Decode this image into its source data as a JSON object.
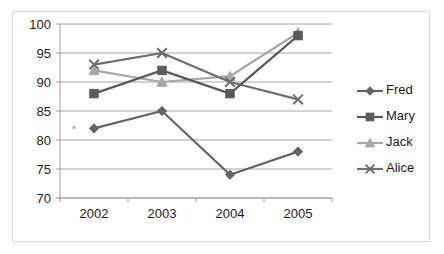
{
  "chart_data": {
    "type": "line",
    "title": "",
    "subtitle": "",
    "xlabel": "",
    "ylabel": "",
    "categories": [
      "2002",
      "2003",
      "2004",
      "2005"
    ],
    "ylim": [
      70,
      100
    ],
    "y_ticks": [
      "70",
      "75",
      "80",
      "85",
      "90",
      "95",
      "100"
    ],
    "y_tick_values": [
      70,
      75,
      80,
      85,
      90,
      95,
      100
    ],
    "grid": true,
    "legend_position": "right",
    "series": [
      {
        "name": "Fred",
        "marker": "diamond",
        "color": "#646464",
        "values": [
          82,
          85,
          74,
          78
        ]
      },
      {
        "name": "Mary",
        "marker": "square",
        "color": "#5a5a5a",
        "values": [
          88,
          92,
          88,
          98
        ]
      },
      {
        "name": "Jack",
        "marker": "triangle",
        "color": "#a8a8a8",
        "values": [
          92,
          90,
          91,
          98.5
        ]
      },
      {
        "name": "Alice",
        "marker": "x",
        "color": "#6e6e6e",
        "values": [
          93,
          95,
          90,
          87
        ]
      }
    ]
  },
  "legend": {
    "items": [
      {
        "label": "Fred"
      },
      {
        "label": "Mary"
      },
      {
        "label": "Jack"
      },
      {
        "label": "Alice"
      }
    ]
  },
  "colors": {
    "gridline": "#a6a6a6",
    "axis": "#9c9c9c",
    "frame_border": "#d9d9d9",
    "background": "#ffffff",
    "text": "#1a1a1a"
  }
}
